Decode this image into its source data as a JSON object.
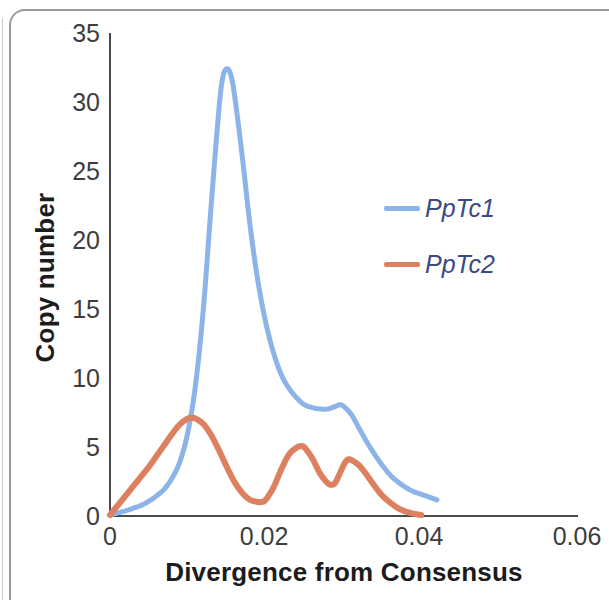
{
  "figure": {
    "frame_color": "#9a9a9a",
    "background": "#ffffff"
  },
  "axis": {
    "x_title": "Divergence from Consensus",
    "y_title": "Copy number",
    "x_ticks": [
      "0",
      "0.02",
      "0.04",
      "0.06"
    ],
    "y_ticks": [
      "0",
      "5",
      "10",
      "15",
      "20",
      "25",
      "30",
      "35"
    ],
    "axis_color": "#4a4a4a",
    "tick_text_color": "#3d3d3d"
  },
  "legend": {
    "position": "inside-right",
    "entries": [
      {
        "label": "PpTc1",
        "color": "#8CB4E8"
      },
      {
        "label": "PpTc2",
        "color": "#DD8060"
      }
    ],
    "text_color": "#3a4a82"
  },
  "chart_data": {
    "type": "line",
    "title": "",
    "subtitle": "",
    "xlabel": "Divergence from Consensus",
    "ylabel": "Copy number",
    "xlim": [
      0,
      0.06
    ],
    "ylim": [
      0,
      35
    ],
    "x_ticks": [
      0,
      0.02,
      0.04,
      0.06
    ],
    "y_ticks": [
      0,
      5,
      10,
      15,
      20,
      25,
      30,
      35
    ],
    "grid": false,
    "legend_position": "inside-right",
    "annotations": [],
    "series": [
      {
        "name": "PpTc1",
        "color": "#8CB4E8",
        "x": [
          0.0,
          0.001,
          0.002,
          0.003,
          0.004,
          0.005,
          0.006,
          0.007,
          0.008,
          0.009,
          0.01,
          0.011,
          0.012,
          0.013,
          0.014,
          0.0145,
          0.015,
          0.0155,
          0.016,
          0.017,
          0.018,
          0.019,
          0.02,
          0.021,
          0.022,
          0.023,
          0.024,
          0.025,
          0.026,
          0.027,
          0.028,
          0.029,
          0.0295,
          0.03,
          0.031,
          0.032,
          0.033,
          0.034,
          0.035,
          0.036,
          0.037,
          0.038,
          0.039,
          0.04,
          0.041,
          0.042
        ],
        "y": [
          0.0,
          0.15,
          0.3,
          0.5,
          0.7,
          1.0,
          1.4,
          1.9,
          2.7,
          3.9,
          6.0,
          9.5,
          15.0,
          22.5,
          29.5,
          31.8,
          32.4,
          32.0,
          30.5,
          26.0,
          21.0,
          17.0,
          14.0,
          11.8,
          10.2,
          9.2,
          8.5,
          8.0,
          7.8,
          7.7,
          7.7,
          7.9,
          8.0,
          7.9,
          7.3,
          6.3,
          5.3,
          4.4,
          3.6,
          2.9,
          2.4,
          2.0,
          1.7,
          1.5,
          1.3,
          1.1
        ]
      },
      {
        "name": "PpTc2",
        "color": "#DD8060",
        "x": [
          0.0,
          0.001,
          0.002,
          0.003,
          0.004,
          0.005,
          0.006,
          0.007,
          0.008,
          0.009,
          0.01,
          0.0105,
          0.011,
          0.012,
          0.013,
          0.014,
          0.015,
          0.016,
          0.017,
          0.018,
          0.019,
          0.0195,
          0.02,
          0.021,
          0.022,
          0.023,
          0.024,
          0.0245,
          0.025,
          0.026,
          0.027,
          0.028,
          0.0285,
          0.029,
          0.03,
          0.0305,
          0.031,
          0.032,
          0.033,
          0.034,
          0.035,
          0.036,
          0.037,
          0.038,
          0.039,
          0.04
        ],
        "y": [
          0.0,
          0.7,
          1.4,
          2.1,
          2.8,
          3.5,
          4.3,
          5.1,
          5.9,
          6.6,
          7.0,
          7.05,
          7.0,
          6.6,
          5.8,
          4.7,
          3.5,
          2.4,
          1.6,
          1.1,
          0.95,
          0.95,
          1.1,
          2.0,
          3.3,
          4.4,
          4.9,
          5.0,
          4.9,
          4.1,
          3.0,
          2.3,
          2.2,
          2.4,
          3.6,
          4.0,
          4.0,
          3.6,
          2.9,
          2.1,
          1.4,
          0.9,
          0.5,
          0.25,
          0.1,
          0.0
        ]
      }
    ]
  }
}
